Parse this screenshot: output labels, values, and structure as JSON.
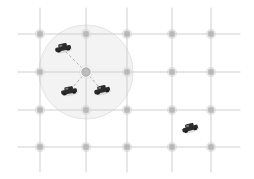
{
  "scene": {
    "title": "vehicular-network-grid",
    "width": 254,
    "height": 179,
    "background_color": "#ffffff"
  },
  "road_grid": {
    "name": "street-grid",
    "line_color": "#c9c9c9",
    "line_width": 0.9,
    "column_x": [
      40,
      86,
      127,
      172,
      211
    ],
    "row_y": [
      34,
      72,
      110,
      147
    ],
    "horizontal_extent": [
      18,
      240
    ],
    "vertical_extent": [
      8,
      172
    ]
  },
  "intersections": {
    "name": "intersection-nodes",
    "fill_color": "#b9b9b9",
    "stroke_color": "#d8d8d8",
    "radius": 3.4,
    "halo_radius": 4.6,
    "points": [
      {
        "x": 40,
        "y": 34
      },
      {
        "x": 86,
        "y": 34
      },
      {
        "x": 127,
        "y": 34
      },
      {
        "x": 172,
        "y": 34
      },
      {
        "x": 211,
        "y": 34
      },
      {
        "x": 40,
        "y": 72
      },
      {
        "x": 86,
        "y": 72
      },
      {
        "x": 127,
        "y": 72
      },
      {
        "x": 172,
        "y": 72
      },
      {
        "x": 211,
        "y": 72
      },
      {
        "x": 40,
        "y": 110
      },
      {
        "x": 86,
        "y": 110
      },
      {
        "x": 127,
        "y": 110
      },
      {
        "x": 172,
        "y": 110
      },
      {
        "x": 211,
        "y": 110
      },
      {
        "x": 40,
        "y": 147
      },
      {
        "x": 86,
        "y": 147
      },
      {
        "x": 127,
        "y": 147
      },
      {
        "x": 172,
        "y": 147
      },
      {
        "x": 211,
        "y": 147
      }
    ]
  },
  "coverage_circle": {
    "name": "communication-range-circle",
    "center_x": 86,
    "center_y": 72,
    "radius": 47,
    "fill_color": "#f1f1f1",
    "stroke_color": "#e4e4e4",
    "opacity": 0.85
  },
  "anchor_node": {
    "name": "roadside-unit",
    "x": 86,
    "y": 72,
    "radius": 4.2,
    "fill_color": "#bcbcbc",
    "stroke_color": "#9f9f9f"
  },
  "vehicles": [
    {
      "id": "vehicle-1",
      "x": 63,
      "y": 48,
      "rotation": -12,
      "scale": 1.0,
      "in_range": true,
      "body_color": "#2b2b2b",
      "shadow_color": "#bdbdbd"
    },
    {
      "id": "vehicle-2",
      "x": 69,
      "y": 91,
      "rotation": -10,
      "scale": 1.0,
      "in_range": true,
      "body_color": "#2b2b2b",
      "shadow_color": "#bdbdbd"
    },
    {
      "id": "vehicle-3",
      "x": 102,
      "y": 90,
      "rotation": -14,
      "scale": 1.0,
      "in_range": true,
      "body_color": "#2b2b2b",
      "shadow_color": "#bdbdbd"
    },
    {
      "id": "vehicle-4",
      "x": 190,
      "y": 128,
      "rotation": -16,
      "scale": 1.0,
      "in_range": false,
      "body_color": "#2b2b2b",
      "shadow_color": "#bdbdbd"
    }
  ],
  "links": {
    "name": "v2i-links",
    "stroke_color": "#a8a8a8",
    "stroke_width": 0.9,
    "dash_pattern": "3 2.2",
    "edges": [
      {
        "id": "link-1",
        "from_x": 86,
        "from_y": 72,
        "to_x": 66,
        "to_y": 52
      },
      {
        "id": "link-2",
        "from_x": 86,
        "from_y": 72,
        "to_x": 72,
        "to_y": 88
      },
      {
        "id": "link-3",
        "from_x": 86,
        "from_y": 72,
        "to_x": 99,
        "to_y": 87
      }
    ]
  }
}
